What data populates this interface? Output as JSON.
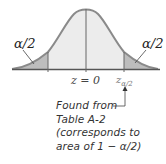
{
  "diagram": {
    "type": "normal-distribution-two-tailed",
    "labels": {
      "left_tail": "α/2",
      "right_tail": "α/2",
      "center": "z = 0",
      "critical_value_main": "z",
      "critical_value_sub": "α/2"
    },
    "annotation": {
      "lines": [
        "Found from",
        "Table A-2",
        "(corresponds to",
        "area of 1 − α/2)"
      ]
    },
    "colors": {
      "curve": "#8a8a8a",
      "center_fill": "#ececec",
      "tail_fill": "#bdbdbd",
      "baseline": "#555555",
      "text": "#333333"
    }
  }
}
